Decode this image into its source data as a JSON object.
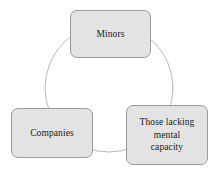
{
  "diagram": {
    "type": "cycle-diagram",
    "shape": "circle",
    "circle": {
      "center_x": 109,
      "center_y": 88,
      "radius": 64,
      "stroke_color": "#b9b9b9",
      "stroke_width": 1,
      "fill": "none"
    },
    "style": {
      "node_fill": "#e3e3e3",
      "node_border": "#9a9a9a",
      "text_color": "#1a1a1a",
      "background": "#ffffff",
      "corner_radius": 7
    },
    "nodes": [
      {
        "id": "minors",
        "label": "Minors",
        "position": "top"
      },
      {
        "id": "companies",
        "label": "Companies",
        "position": "bottom-left"
      },
      {
        "id": "capacity",
        "label": "Those lacking\nmental\ncapacity",
        "position": "bottom-right"
      }
    ]
  }
}
